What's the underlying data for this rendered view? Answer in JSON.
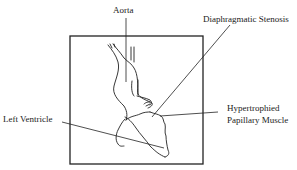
{
  "diagram": {
    "type": "anatomical-schematic",
    "colors": {
      "ink": "#222222",
      "background": "#ffffff"
    },
    "labels": {
      "aorta": "Aorta",
      "diaphragmatic_stenosis": "Diaphragmatic Stenosis",
      "hypertrophied_line1": "Hypertrophied",
      "hypertrophied_line2": "Papillary Muscle",
      "left_ventricle": "Left Ventricle"
    }
  }
}
